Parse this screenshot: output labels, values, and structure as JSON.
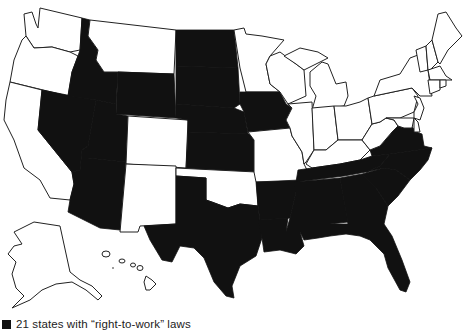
{
  "map": {
    "title": "United States right-to-work states",
    "fill_colors": {
      "right_to_work": "#111111",
      "other": "#ffffff",
      "outline": "#222222"
    },
    "right_to_work_states": [
      "Idaho",
      "Nevada",
      "Utah",
      "Arizona",
      "Wyoming",
      "North Dakota",
      "South Dakota",
      "Nebraska",
      "Kansas",
      "Iowa",
      "Texas",
      "Arkansas",
      "Louisiana",
      "Mississippi",
      "Tennessee",
      "Alabama",
      "Georgia",
      "Florida",
      "South Carolina",
      "North Carolina",
      "Virginia"
    ],
    "other_states": [
      "Washington",
      "Oregon",
      "California",
      "Montana",
      "Colorado",
      "New Mexico",
      "Oklahoma",
      "Minnesota",
      "Wisconsin",
      "Michigan",
      "Illinois",
      "Indiana",
      "Ohio",
      "Missouri",
      "Kentucky",
      "West Virginia",
      "Pennsylvania",
      "New York",
      "Vermont",
      "New Hampshire",
      "Maine",
      "Massachusetts",
      "Connecticut",
      "Rhode Island",
      "New Jersey",
      "Delaware",
      "Maryland",
      "Alaska",
      "Hawaii"
    ]
  },
  "legend": {
    "swatch_color": "#111111",
    "label": "21 states with “right-to-work” laws"
  }
}
